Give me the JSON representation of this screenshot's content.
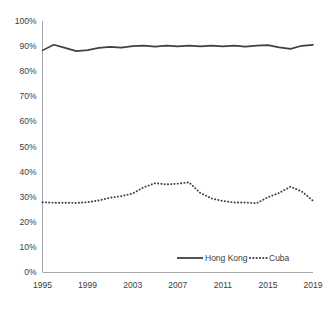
{
  "chart_data": {
    "type": "line",
    "title": "",
    "subtitle": "",
    "xlabel": "",
    "ylabel": "",
    "xlim": [
      1995,
      2019
    ],
    "ylim": [
      0,
      100
    ],
    "y_tick_labels": [
      "0%",
      "10%",
      "20%",
      "30%",
      "40%",
      "50%",
      "60%",
      "70%",
      "80%",
      "90%",
      "100%"
    ],
    "y_tick_values": [
      0,
      10,
      20,
      30,
      40,
      50,
      60,
      70,
      80,
      90,
      100
    ],
    "x_tick_labels": [
      "1995",
      "1999",
      "2003",
      "2007",
      "2011",
      "2015",
      "2019"
    ],
    "x_tick_values": [
      1995,
      1999,
      2003,
      2007,
      2011,
      2015,
      2019
    ],
    "x": [
      1995,
      1996,
      1997,
      1998,
      1999,
      2000,
      2001,
      2002,
      2003,
      2004,
      2005,
      2006,
      2007,
      2008,
      2009,
      2010,
      2011,
      2012,
      2013,
      2014,
      2015,
      2016,
      2017,
      2018,
      2019
    ],
    "grid": false,
    "legend_position": "bottom-right",
    "series": [
      {
        "name": "Hong Kong",
        "style": "solid",
        "color": "#404040",
        "values": [
          88.3,
          90.5,
          89.3,
          88.0,
          88.4,
          89.3,
          89.7,
          89.4,
          90.0,
          90.2,
          89.8,
          90.2,
          89.9,
          90.2,
          89.9,
          90.2,
          89.9,
          90.2,
          89.8,
          90.2,
          90.4,
          89.5,
          88.9,
          90.1,
          90.5
        ]
      },
      {
        "name": "Cuba",
        "style": "dotted",
        "color": "#404040",
        "values": [
          27.8,
          27.6,
          27.6,
          27.5,
          27.8,
          28.5,
          29.6,
          30.2,
          31.3,
          33.8,
          35.4,
          34.9,
          35.2,
          35.7,
          31.5,
          29.3,
          28.3,
          27.7,
          27.7,
          27.4,
          28.0,
          28.4,
          28.7,
          29.1,
          29.5
        ]
      }
    ],
    "series_cuba_tail": {
      "note": "trailing years after 2015 visible in plot",
      "x": [
        2015,
        2016,
        2017,
        2018,
        2019
      ],
      "values": [
        29.8,
        31.5,
        34.0,
        32.1,
        28.4
      ]
    },
    "legend": [
      {
        "label": "Hong Kong",
        "style": "solid"
      },
      {
        "label": "Cuba",
        "style": "dotted"
      }
    ]
  },
  "axes": {
    "y_axis_name": "percent-axis",
    "x_axis_name": "year-axis"
  }
}
